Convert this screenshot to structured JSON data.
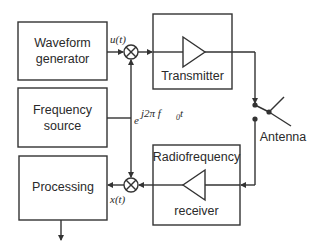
{
  "diagram": {
    "type": "block-diagram",
    "blocks": {
      "waveform_generator": {
        "line1": "Waveform",
        "line2": "generator"
      },
      "frequency_source": {
        "line1": "Frequency",
        "line2": "source"
      },
      "processing": {
        "label": "Processing"
      },
      "transmitter": {
        "label": "Transmitter"
      },
      "receiver": {
        "line1": "Radiofrequency",
        "line2": "receiver"
      },
      "antenna": {
        "label": "Antenna"
      }
    },
    "signals": {
      "baseband_tx": "u(t)",
      "baseband_rx": "x(t)",
      "carrier_base": "e",
      "carrier_exponent": "j2π f",
      "carrier_subscript": "0",
      "carrier_tail": " t"
    },
    "colors": {
      "stroke": "#333333",
      "text": "#2a2a2a",
      "background": "#ffffff"
    }
  }
}
